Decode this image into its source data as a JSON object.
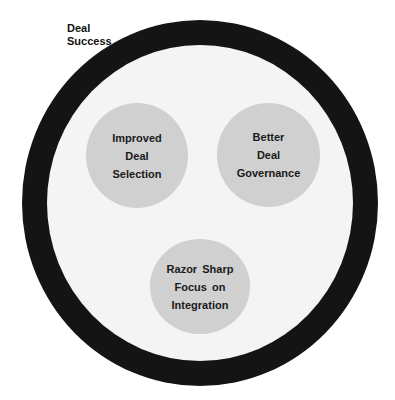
{
  "diagram": {
    "outer_label": [
      "Deal",
      "Success"
    ],
    "nodes": [
      {
        "lines": [
          "Improved",
          "Deal",
          "Selection"
        ]
      },
      {
        "lines": [
          "Better",
          "Deal",
          "Governance"
        ]
      },
      {
        "lines": [
          "Razor Sharp",
          "Focus on",
          "Integration"
        ]
      }
    ],
    "colors": {
      "ring": "#141414",
      "inner_disc": "#f4f4f4",
      "node_fill": "#d0d0d0",
      "text": "#1a1a1a"
    }
  }
}
